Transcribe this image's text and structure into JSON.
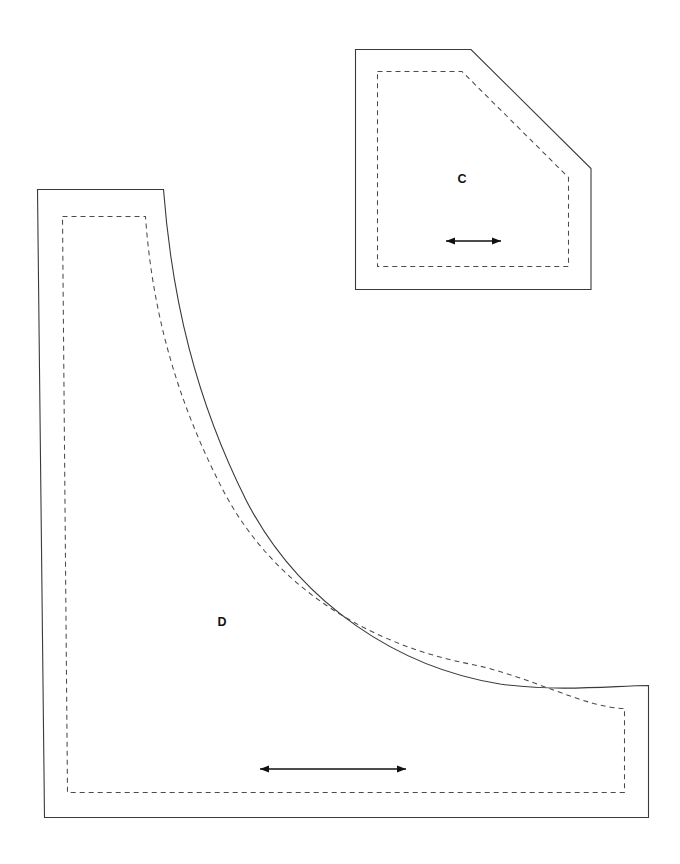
{
  "sheet": {
    "width": 680,
    "height": 864,
    "background_color": "#ffffff",
    "title": "Sewing pattern pieces C and D"
  },
  "style": {
    "cut_line_color": "#3a3a3e",
    "seam_line_color": "#4a4a50",
    "grain_arrow_color": "#111114",
    "label_color": "#111114",
    "seam_dash_pattern": "5 4"
  },
  "pieces": [
    {
      "id": "piece-c",
      "label": "C",
      "label_x": 462,
      "label_y": 180,
      "description": "Pentagonal pattern piece with chamfered top-right corner",
      "cut_line_path": "M 355.5 49.5 L 471 49.5 L 591 168.5 L 591 289.5 L 355.5 289.5 Z",
      "seam_line_path": "M 377.5 71.5 L 462 71.5 L 568.5 177.5 L 568.5 266.5 L 377.5 266.5 Z",
      "grain_arrow": {
        "x1": 446,
        "x2": 501,
        "y": 241
      }
    },
    {
      "id": "piece-d",
      "label": "D",
      "label_x": 222,
      "label_y": 623,
      "description": "Large quarter-round concave pattern piece",
      "cut_line_path": "M 37.5 189.5 L 163.5 189.5 C 172 300 196 400 246 500 C 300 605 400 668 500 684 C 560 692 610 686 648.5 685.5 L 648.5 817.5 L 44.5 817.5 Z",
      "seam_line_path": "M 62.5 216.5 L 145.5 216.5 C 152 310 176 400 224 492 C 276 590 372 645 470 664 C 530 676 585 708 624.5 708.5 L 624.5 792.5 L 67.5 792.5 Z",
      "grain_arrow": {
        "x1": 260,
        "x2": 406,
        "y": 769
      }
    }
  ]
}
